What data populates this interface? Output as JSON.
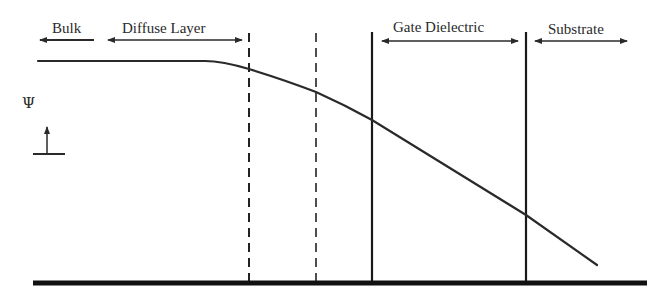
{
  "diagram": {
    "title": "",
    "regions": [
      {
        "label": "Bulk",
        "arrow": "left",
        "x1": 40,
        "x2": 94,
        "text_x": 52
      },
      {
        "label": "Diffuse Layer",
        "arrow": "both",
        "x1": 108,
        "x2": 242,
        "text_x": 122
      },
      {
        "label": "Gate Dielectric",
        "arrow": "both",
        "x1": 382,
        "x2": 518,
        "text_x": 393
      },
      {
        "label": "Substrate",
        "arrow": "both",
        "x1": 535,
        "x2": 627,
        "text_x": 548
      }
    ],
    "axis_symbol": "Ψ",
    "boundaries": [
      {
        "name": "diffuse-start",
        "x": 249,
        "style": "dashed"
      },
      {
        "name": "diffuse-end",
        "x": 316,
        "style": "dashed"
      },
      {
        "name": "dielectric-start",
        "x": 372,
        "style": "solid"
      },
      {
        "name": "dielectric-end",
        "x": 526,
        "style": "solid"
      }
    ],
    "potential_curve": {
      "description": "Electric potential profile: flat in bulk, decaying through diffuse layer, linear drop across gate dielectric, continuing into substrate",
      "points": [
        [
          38,
          61
        ],
        [
          210,
          61
        ],
        [
          249,
          69
        ],
        [
          316,
          92
        ],
        [
          372,
          120
        ],
        [
          526,
          215
        ],
        [
          597,
          265
        ]
      ]
    },
    "baseline_y": 283
  }
}
